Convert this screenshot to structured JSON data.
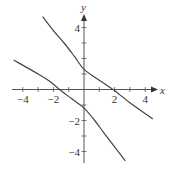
{
  "chart_data": {
    "type": "line",
    "title": "",
    "xlabel": "x",
    "ylabel": "y",
    "xlim": [
      -4.7,
      4.7
    ],
    "ylim": [
      -4.8,
      4.8
    ],
    "grid": false,
    "legend": "none",
    "x_ticks": [
      -4,
      -3,
      -2,
      -1,
      1,
      2,
      3,
      4
    ],
    "y_ticks": [
      -4,
      -3,
      -2,
      -1,
      1,
      2,
      3,
      4
    ],
    "x_tick_labels": [
      {
        "value": -4,
        "label": "-4"
      },
      {
        "value": -2,
        "label": "-2"
      },
      {
        "value": 2,
        "label": "2"
      },
      {
        "value": 4,
        "label": "4"
      }
    ],
    "y_tick_labels": [
      {
        "value": 4,
        "label": "4"
      },
      {
        "value": -2,
        "label": "-2"
      },
      {
        "value": -4,
        "label": "-4"
      }
    ],
    "series": [
      {
        "name": "upper-branch",
        "color": "#444444",
        "points": [
          [
            -2.7,
            4.7
          ],
          [
            -2.0,
            3.8
          ],
          [
            -1.3,
            3.0
          ],
          [
            -0.6,
            2.1
          ],
          [
            0,
            1.3
          ],
          [
            1.0,
            0.6
          ],
          [
            1.9,
            0
          ],
          [
            3.0,
            -0.85
          ],
          [
            4.5,
            -1.9
          ]
        ]
      },
      {
        "name": "lower-branch",
        "color": "#444444",
        "points": [
          [
            -4.6,
            1.9
          ],
          [
            -3.0,
            1.0
          ],
          [
            -2.2,
            0.5
          ],
          [
            -1.6,
            0
          ],
          [
            -0.8,
            -0.6
          ],
          [
            0,
            -1.2
          ],
          [
            0.7,
            -2.0
          ],
          [
            1.3,
            -2.8
          ],
          [
            2.0,
            -3.7
          ],
          [
            2.7,
            -4.6
          ]
        ]
      }
    ]
  },
  "layout": {
    "origin_px": [
      84,
      89.5
    ],
    "unit_px_x": 15.3,
    "unit_px_y": 15.5,
    "axis_color": "#555555",
    "curve_color": "#444444"
  }
}
